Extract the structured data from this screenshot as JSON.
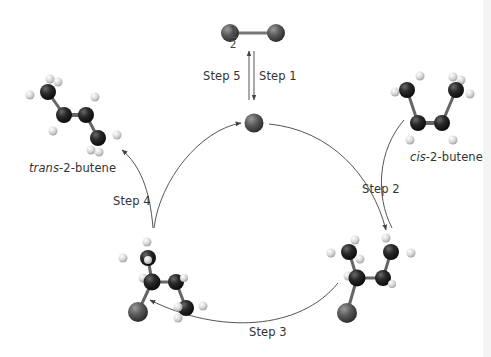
{
  "diagram": {
    "type": "catalytic-cycle",
    "title": "",
    "fraction": {
      "numerator": "1",
      "denominator": "2"
    },
    "species": {
      "h2": {
        "label": "H2 molecule (dark spheres)"
      },
      "catalyst": {
        "label": "catalyst atom"
      },
      "cis": {
        "prefix": "cis",
        "suffix": "-2-butene"
      },
      "trans": {
        "prefix": "trans",
        "suffix": "-2-butene"
      }
    },
    "steps": [
      {
        "id": 1,
        "label": "Step 1"
      },
      {
        "id": 2,
        "label": "Step 2"
      },
      {
        "id": 3,
        "label": "Step 3"
      },
      {
        "id": 4,
        "label": "Step 4"
      },
      {
        "id": 5,
        "label": "Step 5"
      }
    ],
    "colors": {
      "carbon": "#1f1f1f",
      "hydrogen": "#dcdcdc",
      "halogen": "#555555",
      "bond": "#6a6a6a",
      "arrow": "#555555",
      "text": "#333333"
    }
  }
}
